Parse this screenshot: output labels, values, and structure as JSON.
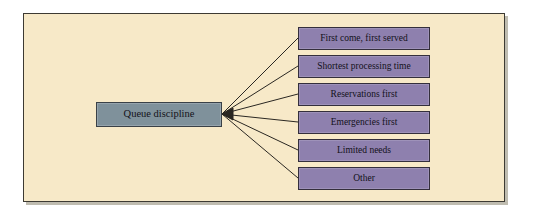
{
  "diagram": {
    "title": "Queue discipline",
    "background_color": "#f7e9c8",
    "frame_border_color": "#3d3a33",
    "root": {
      "label": "Queue discipline",
      "fill_color": "#7f919b",
      "border_color": "#3a4147"
    },
    "leaf_fill_color": "#8e80ae",
    "leaf_border_color": "#342f3c",
    "connector_color": "#2a2722",
    "branches": [
      {
        "label": "First come, first served"
      },
      {
        "label": "Shortest processing time"
      },
      {
        "label": "Reservations first"
      },
      {
        "label": "Emergencies first"
      },
      {
        "label": "Limited needs"
      },
      {
        "label": "Other"
      }
    ]
  }
}
